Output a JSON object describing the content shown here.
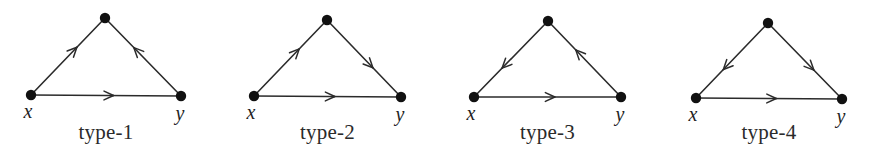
{
  "figure": {
    "background_color": "#ffffff",
    "ink_color": "#2b2b2b",
    "node_color": "#111111",
    "panels": [
      {
        "id": "type-1",
        "caption": "type-1",
        "node_labels": {
          "left": "x",
          "right": "y",
          "apex": ""
        },
        "nodes": [
          {
            "name": "apex",
            "x": 105,
            "y": 18
          },
          {
            "name": "x",
            "x": 31,
            "y": 95
          },
          {
            "name": "y",
            "x": 181,
            "y": 96
          }
        ],
        "edges": [
          {
            "from": "x",
            "to": "apex",
            "arrow": "toward-apex"
          },
          {
            "from": "y",
            "to": "apex",
            "arrow": "toward-apex"
          },
          {
            "from": "x",
            "to": "y",
            "arrow": "toward-y"
          }
        ]
      },
      {
        "id": "type-2",
        "caption": "type-2",
        "node_labels": {
          "left": "x",
          "right": "y",
          "apex": ""
        },
        "nodes": [
          {
            "name": "apex",
            "x": 327,
            "y": 20
          },
          {
            "name": "x",
            "x": 254,
            "y": 96
          },
          {
            "name": "y",
            "x": 401,
            "y": 97
          }
        ],
        "edges": [
          {
            "from": "x",
            "to": "apex",
            "arrow": "toward-apex"
          },
          {
            "from": "apex",
            "to": "y",
            "arrow": "toward-y"
          },
          {
            "from": "x",
            "to": "y",
            "arrow": "toward-y"
          }
        ]
      },
      {
        "id": "type-3",
        "caption": "type-3",
        "node_labels": {
          "left": "x",
          "right": "y",
          "apex": ""
        },
        "nodes": [
          {
            "name": "apex",
            "x": 548,
            "y": 21
          },
          {
            "name": "x",
            "x": 474,
            "y": 97
          },
          {
            "name": "y",
            "x": 621,
            "y": 97
          }
        ],
        "edges": [
          {
            "from": "apex",
            "to": "x",
            "arrow": "toward-x"
          },
          {
            "from": "y",
            "to": "apex",
            "arrow": "toward-apex"
          },
          {
            "from": "x",
            "to": "y",
            "arrow": "toward-y"
          }
        ]
      },
      {
        "id": "type-4",
        "caption": "type-4",
        "node_labels": {
          "left": "x",
          "right": "y",
          "apex": ""
        },
        "nodes": [
          {
            "name": "apex",
            "x": 768,
            "y": 23
          },
          {
            "name": "x",
            "x": 696,
            "y": 98
          },
          {
            "name": "y",
            "x": 842,
            "y": 99
          }
        ],
        "edges": [
          {
            "from": "apex",
            "to": "x",
            "arrow": "toward-x"
          },
          {
            "from": "apex",
            "to": "y",
            "arrow": "toward-y"
          },
          {
            "from": "x",
            "to": "y",
            "arrow": "toward-y"
          }
        ]
      }
    ]
  }
}
